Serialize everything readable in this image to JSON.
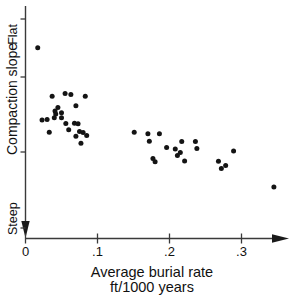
{
  "chart_data": {
    "type": "scatter",
    "title": "",
    "xlabel": "Average burial rate",
    "xlabel_line2": "ft/1000 years",
    "ylabel": "Compaction slope",
    "y_top_label": "Flat",
    "y_bottom_label": "Steep",
    "x_ticks": [
      "0",
      ".1",
      ".2",
      ".3"
    ],
    "x_tick_values": [
      0,
      0.1,
      0.2,
      0.3
    ],
    "xlim": [
      0,
      0.36
    ],
    "ylim": [
      0,
      1
    ],
    "y_ticks_unlabeled": 3,
    "grid": false,
    "legend": "none",
    "y_axis_direction": "Flat at top, Steep at bottom (arrow points down)",
    "point_count": 42,
    "points": [
      {
        "x": 0.017,
        "y": 0.812
      },
      {
        "x": 0.037,
        "y": 0.593
      },
      {
        "x": 0.042,
        "y": 0.513
      },
      {
        "x": 0.045,
        "y": 0.543
      },
      {
        "x": 0.055,
        "y": 0.606
      },
      {
        "x": 0.023,
        "y": 0.487
      },
      {
        "x": 0.03,
        "y": 0.489
      },
      {
        "x": 0.04,
        "y": 0.497
      },
      {
        "x": 0.041,
        "y": 0.527
      },
      {
        "x": 0.033,
        "y": 0.431
      },
      {
        "x": 0.05,
        "y": 0.519
      },
      {
        "x": 0.05,
        "y": 0.497
      },
      {
        "x": 0.056,
        "y": 0.471
      },
      {
        "x": 0.06,
        "y": 0.443
      },
      {
        "x": 0.063,
        "y": 0.601
      },
      {
        "x": 0.068,
        "y": 0.472
      },
      {
        "x": 0.07,
        "y": 0.551
      },
      {
        "x": 0.07,
        "y": 0.413
      },
      {
        "x": 0.073,
        "y": 0.47
      },
      {
        "x": 0.075,
        "y": 0.435
      },
      {
        "x": 0.077,
        "y": 0.382
      },
      {
        "x": 0.08,
        "y": 0.43
      },
      {
        "x": 0.083,
        "y": 0.593
      },
      {
        "x": 0.085,
        "y": 0.417
      },
      {
        "x": 0.151,
        "y": 0.431
      },
      {
        "x": 0.17,
        "y": 0.425
      },
      {
        "x": 0.172,
        "y": 0.391
      },
      {
        "x": 0.177,
        "y": 0.313
      },
      {
        "x": 0.18,
        "y": 0.298
      },
      {
        "x": 0.186,
        "y": 0.425
      },
      {
        "x": 0.196,
        "y": 0.363
      },
      {
        "x": 0.208,
        "y": 0.356
      },
      {
        "x": 0.211,
        "y": 0.327
      },
      {
        "x": 0.215,
        "y": 0.34
      },
      {
        "x": 0.217,
        "y": 0.39
      },
      {
        "x": 0.221,
        "y": 0.302
      },
      {
        "x": 0.236,
        "y": 0.39
      },
      {
        "x": 0.238,
        "y": 0.358
      },
      {
        "x": 0.268,
        "y": 0.301
      },
      {
        "x": 0.272,
        "y": 0.268
      },
      {
        "x": 0.278,
        "y": 0.281
      },
      {
        "x": 0.289,
        "y": 0.347
      },
      {
        "x": 0.345,
        "y": 0.185
      }
    ]
  }
}
